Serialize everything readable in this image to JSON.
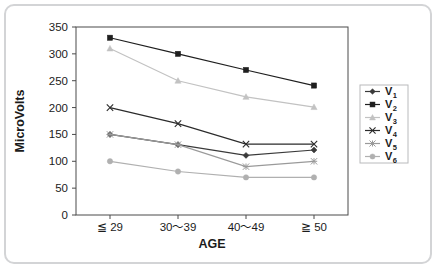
{
  "chart_data": {
    "type": "line",
    "title": "",
    "xlabel": "AGE",
    "ylabel": "MicroVolts",
    "categories": [
      "≦ 29",
      "30〜39",
      "40〜49",
      "≧ 50"
    ],
    "ylim": [
      0,
      350
    ],
    "ytick_labels": [
      "0",
      "50",
      "100",
      "150",
      "200",
      "250",
      "300",
      "350"
    ],
    "ytick_values": [
      0,
      50,
      100,
      150,
      200,
      250,
      300,
      350
    ],
    "grid": false,
    "legend_position": "right",
    "series": [
      {
        "name": "V₁",
        "label_base": "V",
        "label_sub": "1",
        "values": [
          150,
          131,
          111,
          121
        ],
        "color": "#3a3a3a",
        "marker": "diamond"
      },
      {
        "name": "V₂",
        "label_base": "V",
        "label_sub": "2",
        "values": [
          330,
          300,
          270,
          241
        ],
        "color": "#1f1f1f",
        "marker": "square"
      },
      {
        "name": "V₃",
        "label_base": "V",
        "label_sub": "3",
        "values": [
          310,
          250,
          220,
          201
        ],
        "color": "#c2c2c2",
        "marker": "triangle"
      },
      {
        "name": "V₄",
        "label_base": "V",
        "label_sub": "4",
        "values": [
          200,
          170,
          132,
          132
        ],
        "color": "#2b2b2b",
        "marker": "cross"
      },
      {
        "name": "V₅",
        "label_base": "V",
        "label_sub": "5",
        "values": [
          150,
          131,
          90,
          100
        ],
        "color": "#9a9a9a",
        "marker": "asterisk"
      },
      {
        "name": "V₆",
        "label_base": "V",
        "label_sub": "6",
        "values": [
          100,
          81,
          70,
          70
        ],
        "color": "#b0b0b0",
        "marker": "circle"
      }
    ]
  },
  "colors": {
    "frame_border": "#d3d4d6",
    "plot_border": "#4a4a4a",
    "background": "#ffffff",
    "text": "#1b1b1b"
  }
}
